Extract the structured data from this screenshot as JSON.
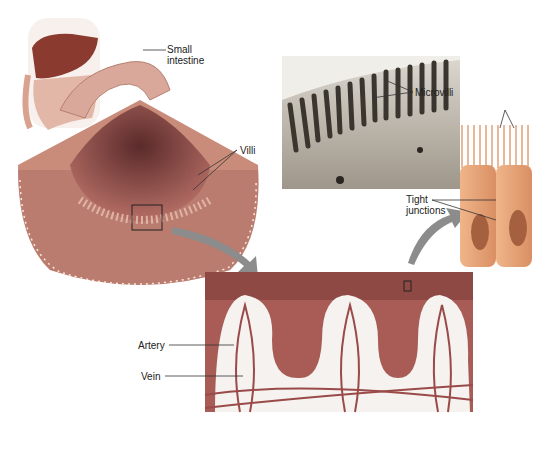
{
  "figure": {
    "labels": {
      "small_intestine": [
        "Small",
        "intestine"
      ],
      "villi": "Villi",
      "microvilli": "Microvilli",
      "tight_junctions": [
        "Tight",
        "junctions"
      ],
      "artery": "Artery",
      "vein": "Vein"
    },
    "colors": {
      "liver": "#8a3a2e",
      "tissue": "#c98c7a",
      "tissue_dark": "#8e4e45",
      "mucosa": "#b06a62",
      "cell": "#e9a77c",
      "nucleus": "#a5603f",
      "micrograph": "#b7b0a4",
      "arrow": "#8c8c8c",
      "vessel": "#9a4a48"
    }
  }
}
